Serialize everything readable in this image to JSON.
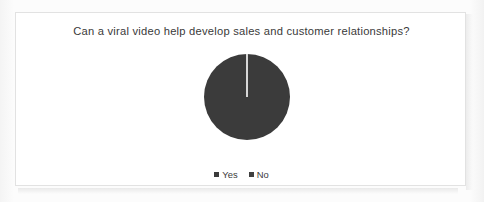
{
  "figure": {
    "title": "Can a viral video help develop sales and customer relationships?",
    "border_color": "#e2e2e2",
    "background_color": "#ffffff"
  },
  "legend": {
    "items": [
      {
        "label": "Yes",
        "color": "#3b3b3b",
        "marker": "square-marker"
      },
      {
        "label": "No",
        "color": "#3f3f3f",
        "marker": "square-marker"
      }
    ]
  },
  "chart_data": {
    "type": "pie",
    "title": "Can a viral video help develop sales and customer relationships?",
    "categories": [
      "Yes",
      "No"
    ],
    "values": [
      100,
      0
    ],
    "unit": "percent",
    "colors": [
      "#3b3b3b",
      "#3f3f3f"
    ],
    "slice_separator_color": "#ffffff",
    "start_angle_deg": 90,
    "legend_position": "bottom",
    "data_labels_shown": false
  }
}
